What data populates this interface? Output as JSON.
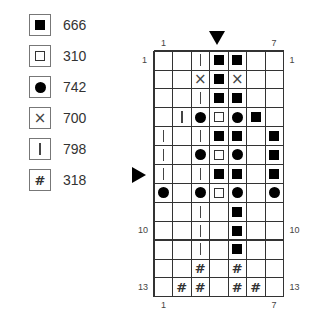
{
  "legend": [
    {
      "symbol": "filled-square",
      "label": "666"
    },
    {
      "symbol": "open-square",
      "label": "310"
    },
    {
      "symbol": "filled-circle",
      "label": "742"
    },
    {
      "symbol": "cross",
      "label": "700"
    },
    {
      "symbol": "vertical-bar",
      "label": "798"
    },
    {
      "symbol": "hash",
      "label": "318"
    }
  ],
  "chart": {
    "columns": 7,
    "rows": 13,
    "column_labels": {
      "first": "1",
      "last": "7"
    },
    "row_labels_left": [
      "1",
      "10",
      "13"
    ],
    "row_labels_right": [
      "1",
      "10",
      "13"
    ],
    "center_column_marker": 4,
    "center_row_marker": 7,
    "symbols": {
      ".": "",
      "F": "filled-square",
      "O": "open-square",
      "D": "filled-circle",
      "X": "cross",
      "I": "vertical-bar",
      "H": "hash"
    },
    "grid": [
      [
        ".",
        ".",
        "I",
        "F",
        "F",
        ".",
        "."
      ],
      [
        ".",
        ".",
        "X",
        "F",
        "X",
        ".",
        "."
      ],
      [
        ".",
        ".",
        "I",
        "F",
        "F",
        ".",
        "."
      ],
      [
        ".",
        "I",
        "D",
        "O",
        "D",
        "F",
        "."
      ],
      [
        "I",
        ".",
        "I",
        "F",
        "F",
        ".",
        "F"
      ],
      [
        "I",
        ".",
        "D",
        "O",
        "D",
        ".",
        "F"
      ],
      [
        "I",
        ".",
        "I",
        "F",
        "F",
        ".",
        "F"
      ],
      [
        "D",
        ".",
        "D",
        "O",
        "D",
        ".",
        "D"
      ],
      [
        ".",
        ".",
        "I",
        ".",
        "F",
        ".",
        "."
      ],
      [
        ".",
        ".",
        "I",
        ".",
        "F",
        ".",
        "."
      ],
      [
        ".",
        ".",
        "I",
        ".",
        "F",
        ".",
        "."
      ],
      [
        ".",
        ".",
        "H",
        ".",
        "H",
        ".",
        "."
      ],
      [
        ".",
        "H",
        "H",
        ".",
        "H",
        "H",
        "."
      ]
    ]
  }
}
